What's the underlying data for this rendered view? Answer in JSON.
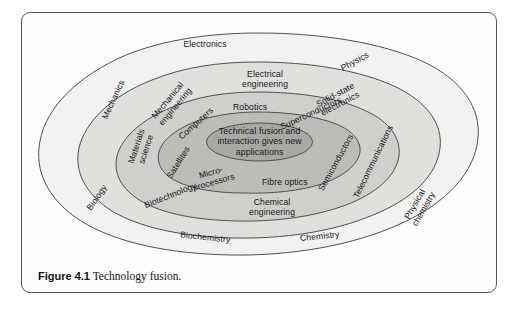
{
  "figure": {
    "caption_label": "Figure 4.1",
    "caption_text": "Technology fusion."
  },
  "diagram": {
    "title": "Technology fusion",
    "type": "concentric-ellipse-venn",
    "core_text": "Technical fusion and\ninteraction gives new\napplications",
    "ring_colors": [
      "#f2f2f0",
      "#e0e0dd",
      "#cfcfcb",
      "#bdbdb8",
      "#a9a9a4"
    ],
    "outline_color": "#4c5054",
    "frame_color": "#55595e",
    "rings": [
      {
        "level": 1,
        "name": "outer-disciplines",
        "labels": [
          {
            "text": "Electronics",
            "x": 205,
            "y": 45,
            "rot": 0,
            "size": 8.6
          },
          {
            "text": "Physics",
            "x": 355,
            "y": 62,
            "rot": -28,
            "size": 8.6
          },
          {
            "text": "Mechanics",
            "x": 114,
            "y": 100,
            "rot": -65,
            "size": 8.6
          },
          {
            "text": "Biology",
            "x": 97,
            "y": 198,
            "rot": -56,
            "size": 8.6
          },
          {
            "text": "Physical\nchemistry",
            "x": 420,
            "y": 207,
            "rot": -60,
            "size": 8.6
          },
          {
            "text": "Biochemistry",
            "x": 205,
            "y": 238,
            "rot": 6,
            "size": 8.6
          },
          {
            "text": "Chemistry",
            "x": 320,
            "y": 237,
            "rot": -6,
            "size": 8.6
          }
        ]
      },
      {
        "level": 2,
        "name": "engineering-fields",
        "labels": [
          {
            "text": "Electrical\nengineering",
            "x": 265,
            "y": 80,
            "rot": 0,
            "size": 8.6
          },
          {
            "text": "Mechanical\nengineering",
            "x": 172,
            "y": 104,
            "rot": -50,
            "size": 8.6
          },
          {
            "text": "Solid-state\nelectronics",
            "x": 338,
            "y": 100,
            "rot": -28,
            "size": 8.6
          },
          {
            "text": "Materials\nscience",
            "x": 142,
            "y": 148,
            "rot": -72,
            "size": 8.6
          },
          {
            "text": "Telecommunications",
            "x": 374,
            "y": 162,
            "rot": -64,
            "size": 8.6
          },
          {
            "text": "Biotechnology",
            "x": 170,
            "y": 196,
            "rot": -22,
            "size": 8.6
          },
          {
            "text": "Chemical\nengineering",
            "x": 272,
            "y": 208,
            "rot": 0,
            "size": 8.6
          }
        ]
      },
      {
        "level": 3,
        "name": "applied-technologies",
        "labels": [
          {
            "text": "Robotics",
            "x": 250,
            "y": 108,
            "rot": 0,
            "size": 8.6
          },
          {
            "text": "Superconductors",
            "x": 311,
            "y": 114,
            "rot": -25,
            "size": 8.6
          },
          {
            "text": "Computers",
            "x": 196,
            "y": 124,
            "rot": -42,
            "size": 8.6
          },
          {
            "text": "Semiconductors",
            "x": 336,
            "y": 163,
            "rot": -61,
            "size": 8.6
          },
          {
            "text": "Satellites",
            "x": 179,
            "y": 163,
            "rot": -58,
            "size": 8.6
          },
          {
            "text": "Micro-\nprocessors",
            "x": 212,
            "y": 178,
            "rot": -16,
            "size": 8.6
          },
          {
            "text": "Fibre optics",
            "x": 285,
            "y": 183,
            "rot": 0,
            "size": 8.6
          }
        ]
      }
    ]
  }
}
